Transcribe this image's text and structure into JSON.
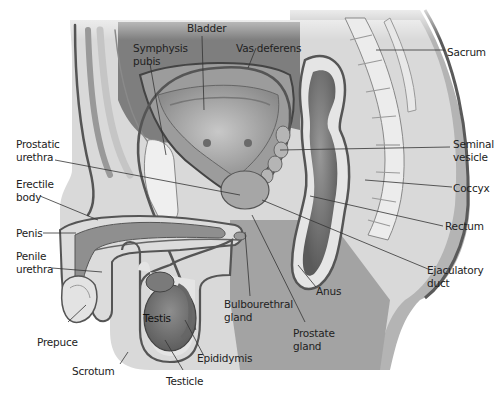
{
  "diagram": {
    "style": "grayscale medical illustration",
    "labels": {
      "bladder": "Bladder",
      "symphysis_pubis_1": "Symphysis",
      "symphysis_pubis_2": "pubis",
      "vas_deferens": "Vas deferens",
      "sacrum": "Sacrum",
      "prostatic_urethra_1": "Prostatic",
      "prostatic_urethra_2": "urethra",
      "seminal_vesicle_1": "Seminal",
      "seminal_vesicle_2": "vesicle",
      "erectile_body_1": "Erectile",
      "erectile_body_2": "body",
      "coccyx": "Coccyx",
      "penis": "Penis",
      "rectum": "Rectum",
      "penile_urethra_1": "Penile",
      "penile_urethra_2": "urethra",
      "ejaculatory_duct_1": "Ejaculatory",
      "ejaculatory_duct_2": "duct",
      "anus": "Anus",
      "bulbourethral_gland_1": "Bulbourethral",
      "bulbourethral_gland_2": "gland",
      "testis": "Testis",
      "prostate_gland_1": "Prostate",
      "prostate_gland_2": "gland",
      "prepuce": "Prepuce",
      "epididymis": "Epididymis",
      "scrotum": "Scrotum",
      "testicle": "Testicle"
    }
  }
}
